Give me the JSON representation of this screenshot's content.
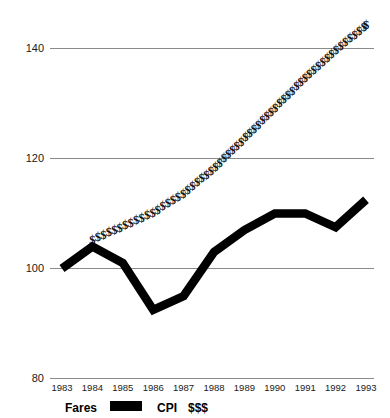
{
  "chart_data": {
    "type": "line",
    "title": "",
    "xlabel": "",
    "ylabel": "",
    "categories": [
      "1983",
      "1984",
      "1985",
      "1986",
      "1987",
      "1988",
      "1989",
      "1990",
      "1991",
      "1992",
      "1993"
    ],
    "x": [
      1983,
      1984,
      1985,
      1986,
      1987,
      1988,
      1989,
      1990,
      1991,
      1992,
      1993
    ],
    "ylim": [
      80,
      148
    ],
    "xlim": [
      1983,
      1993
    ],
    "yticks": [
      80,
      100,
      120,
      140
    ],
    "grid": true,
    "legend_position": "bottom-left",
    "series": [
      {
        "name": "Fares",
        "style": "thick-black-line",
        "values": [
          100,
          104,
          101,
          92.5,
          95,
          103,
          107,
          110,
          110,
          107.5,
          112.5
        ]
      },
      {
        "name": "CPI",
        "style": "dollar-sign-markers",
        "marker": "$",
        "values": [
          null,
          105,
          107.5,
          110,
          113.5,
          118,
          123.5,
          129,
          134.5,
          139.5,
          144
        ]
      }
    ]
  },
  "axis": {
    "y_labels": [
      "140",
      "120",
      "100",
      "80"
    ],
    "x_labels": [
      "1983",
      "1984",
      "1985",
      "1986",
      "1987",
      "1988",
      "1989",
      "1990",
      "1991",
      "1992",
      "1993"
    ]
  },
  "legend": {
    "fares_label": "Fares",
    "cpi_label": "CPI",
    "cpi_symbol": "$$$"
  },
  "colors": {
    "background": "#ffffff",
    "series_fares": "#000000",
    "series_cpi": "#111111",
    "gridline": "#8a8a8a",
    "text": "#1a1a1a"
  }
}
